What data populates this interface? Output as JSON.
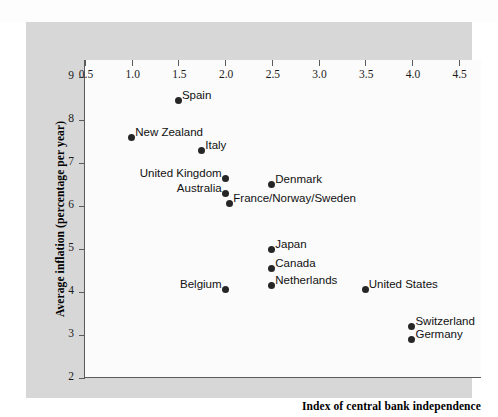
{
  "chart_data": {
    "type": "scatter",
    "title": "",
    "xlabel": "Index of central bank independence",
    "ylabel": "Average inflation (percentage per year)",
    "xlim": [
      0.5,
      4.75
    ],
    "ylim": [
      2,
      9.4
    ],
    "xticks": [
      "0.5",
      "1.0",
      "1.5",
      "2.0",
      "2.5",
      "3.0",
      "3.5",
      "4.0",
      "4.5"
    ],
    "xtick_values": [
      0.5,
      1.0,
      1.5,
      2.0,
      2.5,
      3.0,
      3.5,
      4.0,
      4.5
    ],
    "yticks": [
      "2",
      "3",
      "4",
      "5",
      "6",
      "7",
      "8",
      "9"
    ],
    "ytick_values": [
      2,
      3,
      4,
      5,
      6,
      7,
      8,
      9
    ],
    "grid": false,
    "legend": "none",
    "marker_color": "#262626",
    "points": [
      {
        "label": "Spain",
        "x": 1.5,
        "y": 8.45,
        "label_side": "right"
      },
      {
        "label": "New Zealand",
        "x": 1.0,
        "y": 7.6,
        "label_side": "right"
      },
      {
        "label": "Italy",
        "x": 1.75,
        "y": 7.3,
        "label_side": "right"
      },
      {
        "label": "United Kingdom",
        "x": 2.0,
        "y": 6.65,
        "label_side": "left"
      },
      {
        "label": "Denmark",
        "x": 2.5,
        "y": 6.5,
        "label_side": "right"
      },
      {
        "label": "Australia",
        "x": 2.0,
        "y": 6.3,
        "label_side": "left"
      },
      {
        "label": "France/Norway/Sweden",
        "x": 2.05,
        "y": 6.05,
        "label_side": "right"
      },
      {
        "label": "Japan",
        "x": 2.5,
        "y": 5.0,
        "label_side": "right"
      },
      {
        "label": "Canada",
        "x": 2.5,
        "y": 4.55,
        "label_side": "right"
      },
      {
        "label": "Netherlands",
        "x": 2.5,
        "y": 4.15,
        "label_side": "right"
      },
      {
        "label": "Belgium",
        "x": 2.0,
        "y": 4.05,
        "label_side": "left"
      },
      {
        "label": "United States",
        "x": 3.5,
        "y": 4.05,
        "label_side": "right"
      },
      {
        "label": "Switzerland",
        "x": 4.0,
        "y": 3.2,
        "label_side": "right"
      },
      {
        "label": "Germany",
        "x": 4.0,
        "y": 2.9,
        "label_side": "right"
      }
    ]
  },
  "colors": {
    "panel_background": "#d7d7d7",
    "plot_background": "#fbfbfb",
    "axis": "#5a5a5a",
    "text": "#111111"
  }
}
